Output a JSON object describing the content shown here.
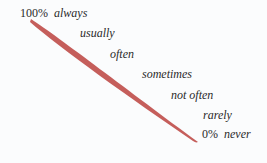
{
  "scale": {
    "top": {
      "percent": "100%",
      "word": "always"
    },
    "levels": [
      "usually",
      "often",
      "sometimes",
      "not often",
      "rarely"
    ],
    "bottom": {
      "percent": "0%",
      "word": "never"
    }
  },
  "colors": {
    "stroke": "#c0504d",
    "background": "#fbfcfd",
    "text": "#2a2a2a"
  }
}
